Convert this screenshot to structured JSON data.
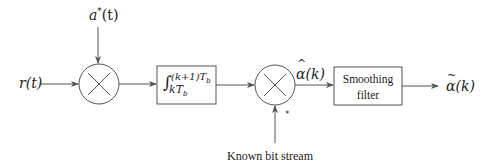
{
  "diagram": {
    "title": "",
    "inputs": {
      "received_signal": "r(t)",
      "conjugate_signal_base": "a",
      "conjugate_signal_sup": "*",
      "conjugate_signal_arg": "(t)"
    },
    "blocks": {
      "multiplier_1": {
        "symbol": "×"
      },
      "integrator": {
        "integral_symbol": "∫",
        "upper_limit": "(k+1)T",
        "upper_limit_sub": "b",
        "lower_limit": "kT",
        "lower_limit_sub": "b"
      },
      "multiplier_2": {
        "symbol": "×",
        "conjugate_mark": "*"
      },
      "smoothing_filter": {
        "line1": "Smoothing",
        "line2": "filter"
      }
    },
    "signals": {
      "estimate": {
        "base": "α",
        "accent": "^",
        "arg": "(k)"
      },
      "smoothed_estimate": {
        "base": "α",
        "accent": "~",
        "arg": "(k)"
      }
    },
    "labels": {
      "known_bit_stream": "Known bit stream"
    },
    "colors": {
      "stroke": "#555555",
      "text": "#222222",
      "background": "#ffffff"
    }
  }
}
